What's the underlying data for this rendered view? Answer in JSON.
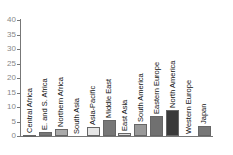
{
  "chart_data": {
    "type": "bar",
    "title": "",
    "xlabel": "",
    "ylabel": "",
    "ylim": [
      0,
      40
    ],
    "yticks": [
      0,
      5,
      10,
      15,
      20,
      25,
      30,
      35,
      40
    ],
    "grid": false,
    "legend": null,
    "categories": [
      "Central Africa",
      "E. and S. Africa",
      "Northern Africa",
      "South Asia",
      "Asia-Pacific",
      "Middle East",
      "East Asia",
      "South America",
      "Eastern Europe",
      "North America",
      "Western Europe",
      "Japan"
    ],
    "values": [
      0.5,
      1.5,
      2.5,
      0,
      3,
      5.5,
      1,
      4,
      7,
      9,
      0,
      3.5
    ],
    "colors": [
      "#555555",
      "#777777",
      "#aaaaaa",
      "#ffffff",
      "#e6e6e6",
      "#777777",
      "#dddddd",
      "#999999",
      "#707070",
      "#3a3a3a",
      "#ffffff",
      "#777777"
    ]
  },
  "axis": {
    "tick_labels": [
      "0",
      "5",
      "10",
      "15",
      "20",
      "25",
      "30",
      "35",
      "40"
    ]
  }
}
